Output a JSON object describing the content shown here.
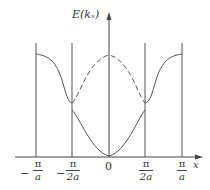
{
  "diagram": {
    "y_axis_label": "E(kₓ)",
    "x_axis_label": "x",
    "origin_label": "0",
    "ticks": [
      {
        "sign": "−",
        "num": "π",
        "den": "a"
      },
      {
        "sign": "−",
        "num": "π",
        "den": "2a"
      },
      {
        "sign": "",
        "num": "π",
        "den": "2a"
      },
      {
        "sign": "",
        "num": "π",
        "den": "a"
      }
    ]
  }
}
